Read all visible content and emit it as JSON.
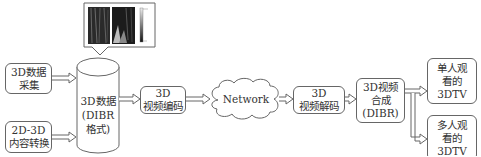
{
  "diagram": {
    "nodes": {
      "capture": {
        "lines": [
          "3D数据",
          "采集"
        ]
      },
      "conversion": {
        "lines": [
          "2D-3D",
          "内容转换"
        ]
      },
      "storage": {
        "lines": [
          "3D数据",
          "(DIBR",
          "格式)"
        ],
        "shape": "cylinder"
      },
      "encode": {
        "lines": [
          "3D",
          "视频编码"
        ]
      },
      "network": {
        "label": "Network",
        "shape": "cloud"
      },
      "decode": {
        "lines": [
          "3D",
          "视频解码"
        ]
      },
      "synthesis": {
        "lines": [
          "3D视频",
          "合成",
          "(DIBR)"
        ]
      },
      "single_view": {
        "lines": [
          "单人观",
          "看的",
          "3DTV"
        ]
      },
      "multi_view": {
        "lines": [
          "多人观",
          "看的",
          "3DTV"
        ]
      }
    },
    "callout": {
      "content": "texture-and-depth-map-images",
      "attached_to": "storage"
    },
    "edges": [
      {
        "from": "capture",
        "to": "storage"
      },
      {
        "from": "conversion",
        "to": "storage"
      },
      {
        "from": "storage",
        "to": "encode"
      },
      {
        "from": "encode",
        "to": "network"
      },
      {
        "from": "network",
        "to": "decode"
      },
      {
        "from": "decode",
        "to": "synthesis"
      },
      {
        "from": "synthesis",
        "to": "single_view"
      },
      {
        "from": "synthesis",
        "to": "multi_view"
      }
    ]
  }
}
